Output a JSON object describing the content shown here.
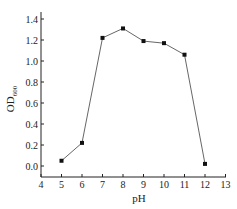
{
  "chart_data": {
    "type": "line",
    "title": "",
    "xlabel": "pH",
    "ylabel": "OD",
    "ylabel_subscript": "600",
    "x": [
      5,
      6,
      7,
      8,
      9,
      10,
      11,
      12
    ],
    "series": [
      {
        "name": "OD600",
        "values": [
          0.05,
          0.22,
          1.22,
          1.31,
          1.19,
          1.17,
          1.06,
          0.02
        ],
        "marker": "square",
        "color": "#111111"
      }
    ],
    "xlim": [
      4,
      13
    ],
    "ylim": [
      -0.1,
      1.45
    ],
    "xticks": [
      "4",
      "5",
      "6",
      "7",
      "8",
      "9",
      "10",
      "11",
      "12",
      "13"
    ],
    "yticks": [
      "0.0",
      "0.2",
      "0.4",
      "0.6",
      "0.8",
      "1.0",
      "1.2",
      "1.4"
    ],
    "grid": false,
    "legend": null
  }
}
